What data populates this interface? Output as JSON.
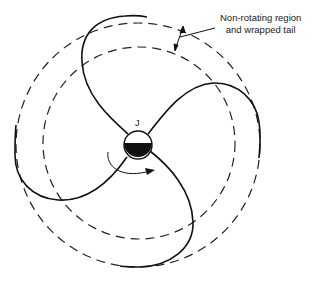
{
  "figure": {
    "annotation": {
      "line1": "Non-rotating region",
      "line2": "and wrapped tail"
    },
    "core_label": "J",
    "colors": {
      "stroke": "#111111",
      "dash": "#222222",
      "text": "#222222",
      "background": "#ffffff"
    },
    "elements": {
      "outer_dashed_circle": {
        "cx": 138,
        "cy": 145,
        "r": 122
      },
      "inner_dashed_circle": {
        "cx": 139,
        "cy": 143,
        "r": 96
      },
      "core_circle": {
        "cx": 138,
        "cy": 145,
        "r": 14
      },
      "spiral_arms": 4,
      "rotation_arrow": "clockwise"
    }
  }
}
